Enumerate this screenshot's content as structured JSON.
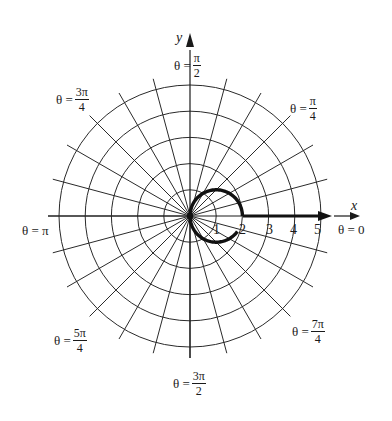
{
  "chart_data": {
    "type": "polar-plot",
    "title": "",
    "curve": {
      "description": "Thick curve: circle r = 2cos(theta) through origin, max r = 2 at theta = 0, drawn with a small gap just below the positive x-axis",
      "center": [
        1,
        0
      ],
      "radius": 1,
      "start_angle_deg": 0,
      "end_angle_deg": 325
    },
    "grid": {
      "circles": [
        1,
        2,
        3,
        4,
        5
      ],
      "radial_step_deg": 15,
      "on": true
    },
    "axes": {
      "x_label": "x",
      "y_label": "y",
      "x_ticks": [
        "1",
        "2",
        "3",
        "4",
        "5"
      ]
    },
    "angle_labels": [
      {
        "id": "0",
        "prefix": "θ = ",
        "value": "0"
      },
      {
        "id": "pi4",
        "prefix": "θ = ",
        "num": "π",
        "den": "4"
      },
      {
        "id": "pi2",
        "prefix": "θ = ",
        "num": "π",
        "den": "2"
      },
      {
        "id": "3pi4",
        "prefix": "θ = ",
        "num": "3π",
        "den": "4"
      },
      {
        "id": "pi",
        "prefix": "θ = ",
        "value": "π"
      },
      {
        "id": "5pi4",
        "prefix": "θ = ",
        "num": "5π",
        "den": "4"
      },
      {
        "id": "3pi2",
        "prefix": "θ = ",
        "num": "3π",
        "den": "2"
      },
      {
        "id": "7pi4",
        "prefix": "θ = ",
        "num": "7π",
        "den": "4"
      }
    ]
  },
  "colors": {
    "grid": "#2a2a2a",
    "curve": "#111111",
    "background": "#ffffff"
  }
}
